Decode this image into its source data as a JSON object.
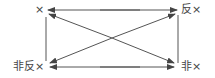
{
  "diagram": {
    "type": "square-of-opposition",
    "nodes": {
      "top_left": "×",
      "top_right": "反×",
      "bottom_left": "非反×",
      "bottom_right": "非×"
    },
    "edges": [
      {
        "from": "top_left",
        "to": "top_right",
        "style": "double-arrow"
      },
      {
        "from": "bottom_left",
        "to": "bottom_right",
        "style": "double-arrow"
      },
      {
        "from": "top_left",
        "to": "bottom_left",
        "style": "line"
      },
      {
        "from": "top_right",
        "to": "bottom_right",
        "style": "line"
      },
      {
        "from": "top_left",
        "to": "bottom_right",
        "style": "double-arrow"
      },
      {
        "from": "bottom_left",
        "to": "top_right",
        "style": "double-arrow"
      }
    ],
    "line_color": "#555555"
  }
}
